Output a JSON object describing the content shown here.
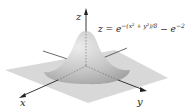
{
  "figure": {
    "equation": {
      "lhs": "z = e",
      "exp1": "−(x² + y²)/8",
      "mid": " − e",
      "exp2": "−2"
    },
    "axes": {
      "x_label": "x",
      "y_label": "y",
      "z_label": "z"
    },
    "colors": {
      "plane": "#d0d0d0",
      "surface_top": "#e4e4e4",
      "surface_shade": "#a8a8a8",
      "axis": "#333333"
    }
  }
}
